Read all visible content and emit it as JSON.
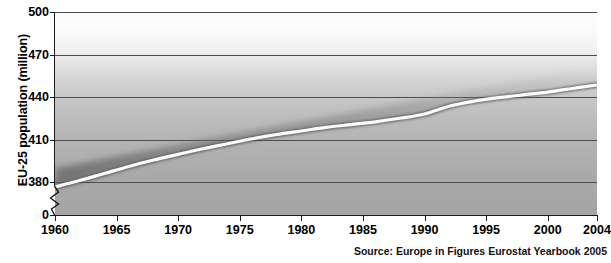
{
  "chart_data": {
    "type": "line",
    "title": "",
    "subtitle": "",
    "xlabel": "",
    "ylabel": "EU-25 population (million)",
    "xlim": [
      1960,
      2004
    ],
    "ylim": [
      380,
      500
    ],
    "y_axis_break": true,
    "y_axis_break_label": "0",
    "grid": true,
    "legend": false,
    "yticks": [
      "500",
      "470",
      "440",
      "410",
      "380",
      "0"
    ],
    "ytick_values": [
      500,
      470,
      440,
      410,
      380,
      0
    ],
    "xticks": [
      "1960",
      "1965",
      "1970",
      "1975",
      "1980",
      "1985",
      "1990",
      "1995",
      "2000",
      "2004"
    ],
    "xtick_values": [
      1960,
      1965,
      1970,
      1975,
      1980,
      1985,
      1990,
      1995,
      2000,
      2004
    ],
    "series": [
      {
        "name": "EU-25 population",
        "color": "#fbfbfb",
        "x": [
          1960,
          1962,
          1964,
          1966,
          1968,
          1970,
          1972,
          1974,
          1976,
          1978,
          1980,
          1982,
          1984,
          1986,
          1988,
          1990,
          1992,
          1994,
          1996,
          1998,
          2000,
          2002,
          2004
        ],
        "values": [
          376.5,
          381.0,
          386.0,
          391.0,
          395.5,
          399.5,
          403.5,
          407.0,
          410.5,
          413.5,
          416.0,
          418.5,
          420.5,
          422.5,
          425.0,
          428.0,
          433.5,
          437.0,
          439.5,
          441.5,
          443.5,
          446.0,
          448.5
        ]
      }
    ],
    "source": "Source: Europe in Figures Eurostat Yearbook 2005"
  },
  "axis": {
    "y_title": "EU-25 population (million)"
  },
  "footer": {
    "source": "Source: Europe in Figures Eurostat Yearbook 2005"
  }
}
